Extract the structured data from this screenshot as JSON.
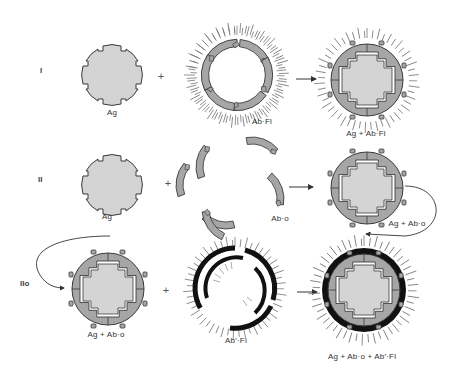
{
  "figure": {
    "colors": {
      "antigen_fill": "#d4d4d4",
      "antibody_fill": "#a6a6a6",
      "outline": "#3a3a3a",
      "secondary_antibody": "#111111",
      "fluorescence_ray": "#6a6a6a",
      "background": "#ffffff"
    },
    "rows": [
      {
        "label": "I",
        "reactant1": {
          "name": "Ag",
          "icon": "antigen-shape"
        },
        "operator": "+",
        "reactant2": {
          "name": "Ab·Fl",
          "icon": "fluorescent-antibody-ring"
        },
        "arrow": "right-arrow",
        "product": {
          "name": "Ag + Ab·Fl",
          "icon": "fluorescent-complex"
        }
      },
      {
        "label": "II",
        "reactant1": {
          "name": "Ag",
          "icon": "antigen-shape"
        },
        "operator": "+",
        "reactant2": {
          "name": "Ab·o",
          "icon": "unlabeled-antibody-fragments"
        },
        "arrow": "right-arrow",
        "product": {
          "name": "Ag + Ab·o",
          "icon": "unlabeled-complex"
        }
      },
      {
        "label": "IIo",
        "reactant1": {
          "name": "Ag + Ab·o",
          "icon": "unlabeled-complex"
        },
        "operator": "+",
        "reactant2": {
          "name": "Ab′·Fl",
          "icon": "fluorescent-secondary-antibody-ring"
        },
        "arrow": "right-arrow",
        "product": {
          "name": "Ag + Ab·o + Ab′·Fl",
          "icon": "sandwich-fluorescent-complex"
        }
      }
    ],
    "connector": "curved-arrow-row-II-to-row-IIo"
  }
}
